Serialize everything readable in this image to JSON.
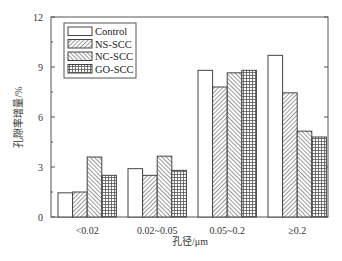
{
  "chart_data": {
    "type": "bar",
    "title": "",
    "xlabel": "孔径/μm",
    "ylabel": "孔隙率增量/%",
    "ylim": [
      0,
      12
    ],
    "yticks": [
      0,
      3,
      6,
      9,
      12
    ],
    "grid": false,
    "legend_position": "upper-left (inside)",
    "categories": [
      "<0.02",
      "0.02~0.05",
      "0.05~0.2",
      "≥0.2"
    ],
    "series": [
      {
        "name": "Control",
        "pattern": "none",
        "values": [
          1.45,
          2.9,
          8.8,
          9.7
        ]
      },
      {
        "name": "NS-SCC",
        "pattern": "diagonal-forward",
        "values": [
          1.5,
          2.5,
          7.8,
          7.45
        ]
      },
      {
        "name": "NC-SCC",
        "pattern": "diagonal-back",
        "values": [
          3.6,
          3.65,
          8.65,
          5.15
        ]
      },
      {
        "name": "GO-SCC",
        "pattern": "grid",
        "values": [
          2.5,
          2.8,
          8.8,
          4.8
        ]
      }
    ]
  },
  "axes": {
    "y_tick_labels": [
      "0",
      "3",
      "6",
      "9",
      "12"
    ],
    "x_tick_labels": [
      "<0.02",
      "0.02~0.05",
      "0.05~0.2",
      "≥0.2"
    ],
    "x_title": "孔径/μm",
    "y_title": "孔隙率增量/%"
  },
  "legend": {
    "items": [
      {
        "label": "Control"
      },
      {
        "label": "NS-SCC"
      },
      {
        "label": "NC-SCC"
      },
      {
        "label": "GO-SCC"
      }
    ]
  },
  "colors": {
    "stroke": "#444444",
    "fill": "#ffffff",
    "pattern": "#555555"
  }
}
